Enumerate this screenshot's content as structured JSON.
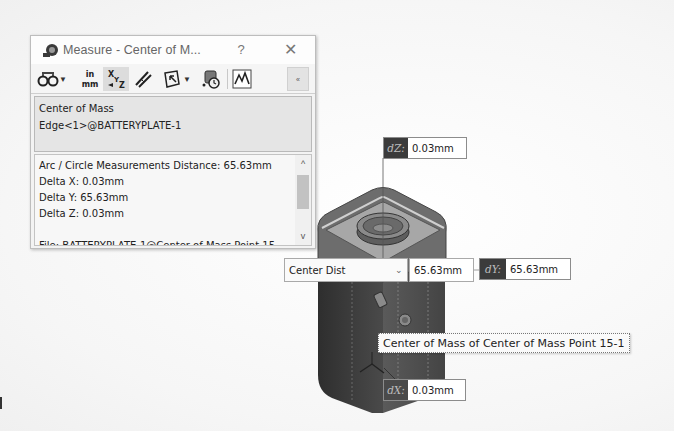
{
  "dialog": {
    "title": "Measure - Center of M...",
    "help_label": "?",
    "close_label": "✕",
    "icons": {
      "app": "measure-icon",
      "close": "close-icon"
    },
    "toolbar": [
      {
        "name": "arc-circle-measurements-icon",
        "has_dropdown": true
      },
      {
        "name": "units-precision-icon",
        "label_top": "in",
        "label_bottom": "mm"
      },
      {
        "name": "show-xyz-measurements-icon",
        "pressed": true
      },
      {
        "name": "point-to-point-icon"
      },
      {
        "name": "projected-on-icon",
        "has_dropdown": true
      },
      {
        "name": "measurement-history-icon"
      },
      {
        "name": "create-sensor-icon"
      }
    ],
    "collapse_label": "«",
    "selections": [
      "Center of Mass",
      "Edge<1>@BATTERYPLATE-1"
    ],
    "results": {
      "lines": [
        "Arc / Circle Measurements Distance: 65.63mm",
        "Delta X: 0.03mm",
        "Delta Y: 65.63mm",
        "Delta Z: 0.03mm",
        "",
        "File: BATTERYPLATE-1@Center of Mass Point 15-"
      ],
      "scroll_up": "^",
      "scroll_down": "v"
    }
  },
  "viewport": {
    "callouts": {
      "dz": {
        "label": "dZ:",
        "value": "0.03mm"
      },
      "dy": {
        "label": "dY:",
        "value": "65.63mm"
      },
      "dx": {
        "label": "dX:",
        "value": "0.03mm"
      }
    },
    "distance_mode": {
      "selected": "Center Dist",
      "chevron": "⌄"
    },
    "distance_value": "65.63mm",
    "tooltip": "Center of Mass of Center of Mass Point 15-1"
  },
  "colors": {
    "callout_label_bg": "#3b3b3b",
    "part_dark": "#3a3a3a",
    "part_face": "#9a9a9a",
    "dialog_bg": "#f3f3f3"
  }
}
